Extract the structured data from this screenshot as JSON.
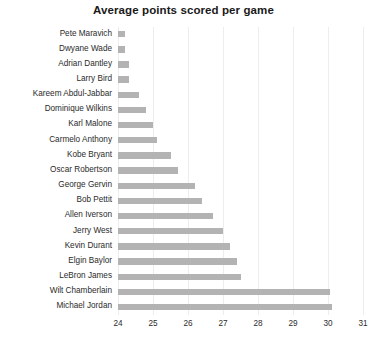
{
  "chart_data": {
    "type": "bar",
    "orientation": "horizontal",
    "title": "Average points scored per game",
    "xlabel": "",
    "ylabel": "",
    "xlim": [
      24,
      31
    ],
    "xticks": [
      "24",
      "25",
      "26",
      "27",
      "28",
      "29",
      "30",
      "31"
    ],
    "grid": true,
    "legend": false,
    "bar_color": "#b3b3b3",
    "background": "#ffffff",
    "categories": [
      "Pete Maravich",
      "Dwyane Wade",
      "Adrian Dantley",
      "Larry Bird",
      "Kareem Abdul-Jabbar",
      "Dominique Wilkins",
      "Karl Malone",
      "Carmelo Anthony",
      "Kobe Bryant",
      "Oscar Robertson",
      "George Gervin",
      "Bob Pettit",
      "Allen Iverson",
      "Jerry West",
      "Kevin Durant",
      "Elgin Baylor",
      "LeBron James",
      "Wilt Chamberlain",
      "Michael Jordan"
    ],
    "values": [
      24.2,
      24.2,
      24.3,
      24.3,
      24.6,
      24.8,
      25.0,
      25.1,
      25.5,
      25.7,
      26.2,
      26.4,
      26.7,
      27.0,
      27.2,
      27.4,
      27.5,
      30.07,
      30.12
    ]
  }
}
